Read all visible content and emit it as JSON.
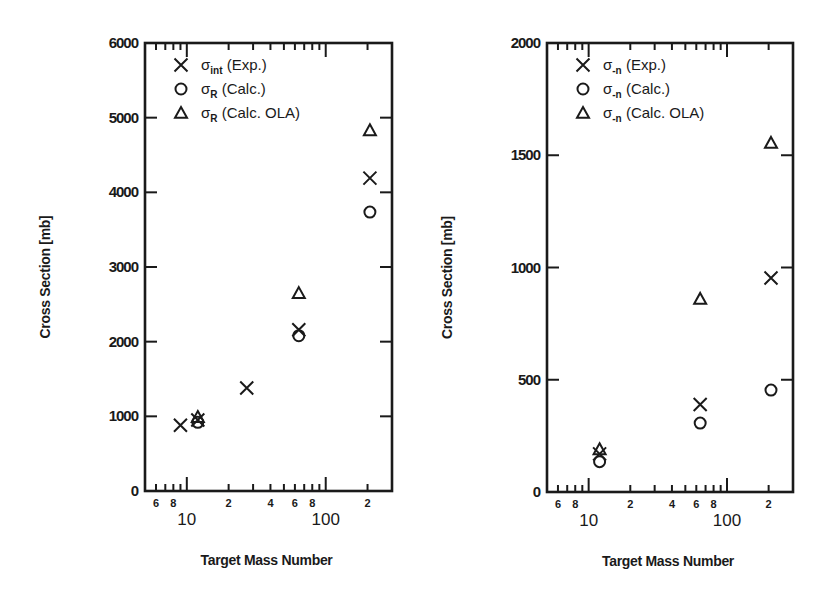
{
  "chart_data": [
    {
      "type": "scatter",
      "panel": "left",
      "title": "",
      "xlabel": "Target Mass Number",
      "ylabel": "Cross Section [mb]",
      "xscale": "log",
      "xlim": [
        5,
        300
      ],
      "ylim": [
        0,
        6000
      ],
      "yticks": [
        0,
        1000,
        2000,
        3000,
        4000,
        5000,
        6000
      ],
      "xtick_minor_labels": [
        "6",
        "8",
        "2",
        "4",
        "6",
        "8",
        "2"
      ],
      "xtick_major_labels": [
        "10",
        "100"
      ],
      "grid": false,
      "legend_position": "upper left",
      "series": [
        {
          "name": "σint (Exp.)",
          "label_main": "σ",
          "label_sub": "int",
          "label_rest": " (Exp.)",
          "marker": "x",
          "points": [
            {
              "x": 9,
              "y": 880
            },
            {
              "x": 12,
              "y": 950
            },
            {
              "x": 27,
              "y": 1380
            },
            {
              "x": 64,
              "y": 2160
            },
            {
              "x": 208,
              "y": 4190
            }
          ]
        },
        {
          "name": "σR (Calc.)",
          "label_main": "σ",
          "label_sub": "R",
          "label_rest": " (Calc.)",
          "marker": "circle",
          "points": [
            {
              "x": 12,
              "y": 920
            },
            {
              "x": 64,
              "y": 2080
            },
            {
              "x": 208,
              "y": 3735
            }
          ]
        },
        {
          "name": "σR (Calc. OLA)",
          "label_main": "σ",
          "label_sub": "R",
          "label_rest": " (Calc. OLA)",
          "marker": "triangle",
          "points": [
            {
              "x": 12,
              "y": 990
            },
            {
              "x": 64,
              "y": 2650
            },
            {
              "x": 208,
              "y": 4830
            }
          ]
        }
      ]
    },
    {
      "type": "scatter",
      "panel": "right",
      "title": "",
      "xlabel": "Target Mass Number",
      "ylabel": "Cross Section [mb]",
      "xscale": "log",
      "xlim": [
        5,
        300
      ],
      "ylim": [
        0,
        2000
      ],
      "yticks": [
        0,
        500,
        1000,
        1500,
        2000
      ],
      "xtick_minor_labels": [
        "6",
        "8",
        "2",
        "4",
        "6",
        "8",
        "2"
      ],
      "xtick_major_labels": [
        "10",
        "100"
      ],
      "grid": false,
      "legend_position": "upper left",
      "series": [
        {
          "name": "σ-n (Exp.)",
          "label_main": "σ",
          "label_sub": "-n",
          "label_rest": " (Exp.)",
          "marker": "x",
          "points": [
            {
              "x": 12,
              "y": 170
            },
            {
              "x": 64,
              "y": 390
            },
            {
              "x": 208,
              "y": 953
            }
          ]
        },
        {
          "name": "σ-n (Calc.)",
          "label_main": "σ",
          "label_sub": "-n",
          "label_rest": " (Calc.)",
          "marker": "circle",
          "points": [
            {
              "x": 12,
              "y": 135
            },
            {
              "x": 64,
              "y": 307
            },
            {
              "x": 208,
              "y": 454
            }
          ]
        },
        {
          "name": "σ-n (Calc. OLA)",
          "label_main": "σ",
          "label_sub": "-n",
          "label_rest": " (Calc. OLA)",
          "marker": "triangle",
          "points": [
            {
              "x": 12,
              "y": 190
            },
            {
              "x": 64,
              "y": 860
            },
            {
              "x": 208,
              "y": 1555
            }
          ]
        }
      ]
    }
  ],
  "panels_layout": [
    {
      "left": 145,
      "right": 392,
      "top": 43,
      "bottom": 491,
      "ylabel_x": 50,
      "tick_label_x": 138
    },
    {
      "left": 547,
      "right": 793,
      "top": 43,
      "bottom": 492,
      "ylabel_x": 452,
      "tick_label_x": 540
    }
  ],
  "colors": {
    "ink": "#1a1a1a",
    "background": "#ffffff"
  }
}
